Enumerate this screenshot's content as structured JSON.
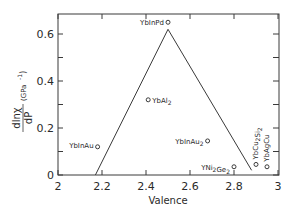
{
  "chart_data": {
    "type": "scatter",
    "title": "",
    "xlabel": "Valence",
    "ylabel": "dlnχ/dP (GPa⁻¹)",
    "ylabel_parts": {
      "num": "dlnχ",
      "den": "dP",
      "unit": "(GPa",
      "exp": "-1",
      "close": ")"
    },
    "xlim": [
      2,
      3
    ],
    "ylim": [
      0,
      0.68
    ],
    "x_ticks": [
      2,
      2.2,
      2.4,
      2.6,
      2.8,
      3
    ],
    "x_tick_labels": [
      "2",
      "2.2",
      "2.4",
      "2.6",
      "2.8",
      "3"
    ],
    "y_ticks": [
      0,
      0.2,
      0.4,
      0.6
    ],
    "y_tick_labels": [
      "0",
      "0.2",
      "0.4",
      "0.6"
    ],
    "grid": false,
    "legend": null,
    "points": [
      {
        "label": "YbInPd",
        "label_html": "YbInPd",
        "x": 2.5,
        "y": 0.65
      },
      {
        "label": "YbAl2",
        "x": 2.41,
        "y": 0.32
      },
      {
        "label": "YbInAu2",
        "x": 2.68,
        "y": 0.145
      },
      {
        "label": "YbInAu",
        "x": 2.18,
        "y": 0.12
      },
      {
        "label": "YNi2Ge2",
        "x": 2.8,
        "y": 0.035
      },
      {
        "label": "YbCu2Si2",
        "x": 2.9,
        "y": 0.045
      },
      {
        "label": "YbAgCu",
        "x": 2.95,
        "y": 0.035
      }
    ],
    "trend_line": {
      "type": "line",
      "description": "triangular guide line",
      "x": [
        2.17,
        2.5,
        2.88
      ],
      "y": [
        0.0,
        0.62,
        0.02
      ]
    }
  }
}
